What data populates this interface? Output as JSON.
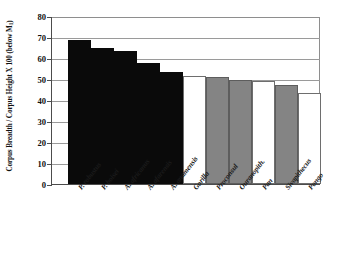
{
  "chart_data": {
    "type": "bar",
    "title": "",
    "xlabel": "",
    "ylabel": "Corpus Breadth / Corpus Height X 100 (below M",
    "ylabel_sub": "1",
    "ylabel_tail": ")",
    "ylim": [
      0,
      80
    ],
    "ytick_step": 10,
    "yticks": [
      "80",
      "70",
      "60",
      "50",
      "40",
      "30",
      "20",
      "10",
      "0"
    ],
    "ytick_values": [
      80,
      70,
      60,
      50,
      40,
      30,
      20,
      10,
      0
    ],
    "grid": true,
    "legend": "none",
    "categories": [
      "P. robustus",
      "P. boisei",
      "A. africanus",
      "A. afarensis",
      "A. anamensis",
      "Gorilla",
      "Proconsul",
      "Ouranopith.",
      "Pan",
      "Sivapithecus",
      "Pongo"
    ],
    "values": [
      68.5,
      65.0,
      63.5,
      57.5,
      53.5,
      51.5,
      51.0,
      49.5,
      49.0,
      47.0,
      43.5
    ],
    "bar_fills": [
      "black",
      "black",
      "black",
      "black",
      "black",
      "white",
      "gray",
      "gray",
      "white",
      "gray",
      "white"
    ],
    "colors": {
      "black": "#0a0a0a",
      "gray": "#848484",
      "white": "#ffffff",
      "axis": "#4c4c4c",
      "grid": "#9a9a9a",
      "text": "#111111",
      "background": "#ffffff"
    }
  }
}
